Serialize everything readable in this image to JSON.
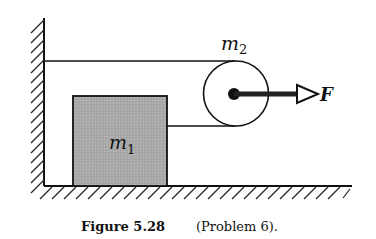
{
  "figure": {
    "labels": {
      "m1_base": "m",
      "m1_sub": "1",
      "m2_base": "m",
      "m2_sub": "2",
      "force": "F"
    },
    "caption": {
      "number": "Figure 5.28",
      "text": "(Problem 6)."
    },
    "colors": {
      "ink": "#111111",
      "block_fill": "#a9a9a9",
      "background": "#ffffff"
    }
  }
}
